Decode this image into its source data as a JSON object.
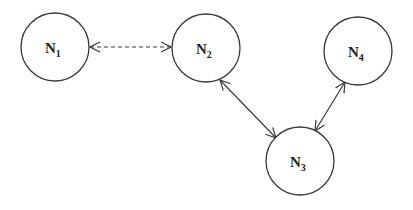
{
  "diagram": {
    "type": "network-graph",
    "nodes": [
      {
        "id": "N1",
        "label": "N",
        "subscript": "1",
        "cx": 55,
        "cy": 47,
        "r": 34
      },
      {
        "id": "N2",
        "label": "N",
        "subscript": "2",
        "cx": 206,
        "cy": 48,
        "r": 34
      },
      {
        "id": "N3",
        "label": "N",
        "subscript": "3",
        "cx": 300,
        "cy": 161,
        "r": 34
      },
      {
        "id": "N4",
        "label": "N",
        "subscript": "4",
        "cx": 358,
        "cy": 51,
        "r": 34
      }
    ],
    "edges": [
      {
        "from": "N1",
        "to": "N2",
        "style": "dashed",
        "direction": "bidirectional"
      },
      {
        "from": "N2",
        "to": "N3",
        "style": "solid",
        "direction": "bidirectional"
      },
      {
        "from": "N4",
        "to": "N3",
        "style": "solid",
        "direction": "bidirectional"
      }
    ],
    "colors": {
      "stroke": "#3a3a3a",
      "background": "#ffffff",
      "text": "#222222"
    }
  }
}
